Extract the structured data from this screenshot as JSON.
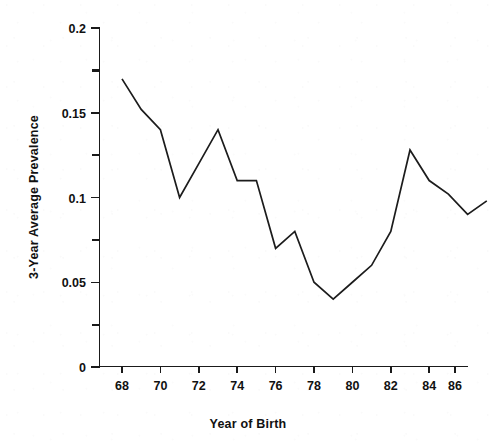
{
  "chart_data": {
    "type": "line",
    "title": "",
    "subtitle": "",
    "xlabel": "Year of Birth",
    "ylabel": "3-Year Average Prevalence",
    "x": [
      68,
      69,
      70,
      71,
      72,
      73,
      74,
      75,
      76,
      77,
      78,
      79,
      80,
      81,
      82,
      83,
      84,
      85,
      86,
      87
    ],
    "values": [
      0.17,
      0.152,
      0.14,
      0.1,
      0.12,
      0.14,
      0.11,
      0.11,
      0.07,
      0.08,
      0.05,
      0.04,
      0.05,
      0.06,
      0.08,
      0.128,
      0.11,
      0.102,
      0.09,
      0.098
    ],
    "xlim": [
      67.3,
      87.5
    ],
    "ylim": [
      0,
      0.2
    ],
    "xticks": [
      68,
      70,
      72,
      74,
      76,
      78,
      80,
      82,
      84,
      86
    ],
    "xtick_labels": [
      "68",
      "70",
      "72",
      "74",
      "76",
      "78",
      "80",
      "82",
      "84",
      "86"
    ],
    "yticks": [
      0,
      0.05,
      0.1,
      0.15,
      0.2
    ],
    "ytick_labels": [
      "0",
      "0.05",
      "0.1",
      "0.15",
      "0.2"
    ],
    "yticks_minor": [
      0.025,
      0.075,
      0.125,
      0.175
    ],
    "grid": false,
    "legend": false,
    "series_color": "#1c1c1c",
    "axis_color": "#1a1a1a",
    "background_color": "#ffffff"
  },
  "axes": {
    "x_axis_label": "Year of Birth",
    "y_axis_label": "3-Year Average Prevalence"
  },
  "ytick_labels": {
    "t0": "0",
    "t1": "0.05",
    "t2": "0.1",
    "t3": "0.15",
    "t4": "0.2"
  },
  "xtick_labels": {
    "t0": "68",
    "t1": "70",
    "t2": "72",
    "t3": "74",
    "t4": "76",
    "t5": "78",
    "t6": "80",
    "t7": "82",
    "t8": "84",
    "t9": "86"
  }
}
